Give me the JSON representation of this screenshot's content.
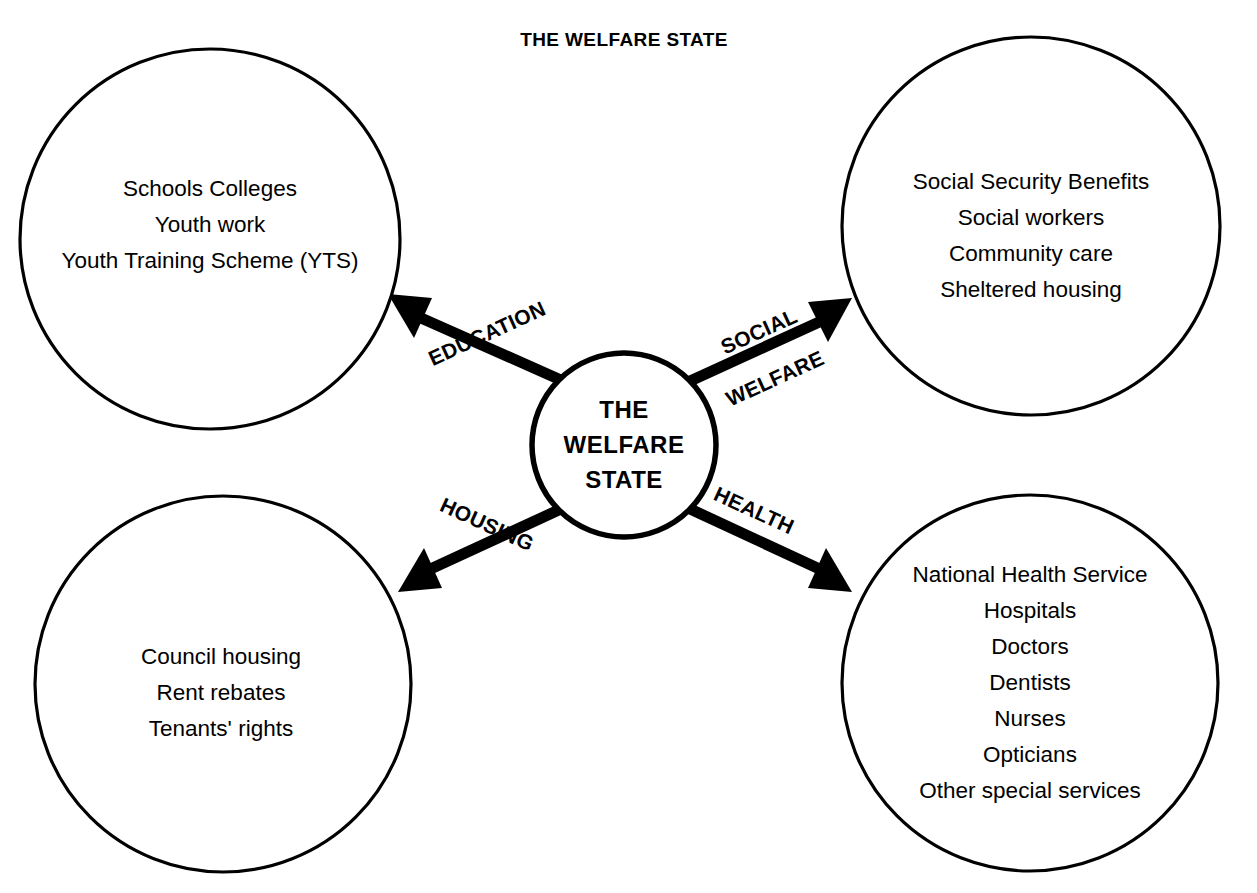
{
  "page": {
    "title": "THE WELFARE STATE",
    "background_color": "#ffffff",
    "stroke_color": "#000000",
    "width": 1257,
    "height": 893
  },
  "center_node": {
    "name": "the-welfare-state",
    "lines": [
      "THE",
      "WELFARE",
      "STATE"
    ],
    "cx": 624,
    "cy": 445,
    "r": 92
  },
  "edges": [
    {
      "id": "education",
      "label_lines": [
        "EDUCATION"
      ],
      "direction": "up-left",
      "target": "education-node"
    },
    {
      "id": "social-welfare",
      "label_lines": [
        "SOCIAL",
        "WELFARE"
      ],
      "direction": "up-right",
      "target": "social-welfare-node"
    },
    {
      "id": "housing",
      "label_lines": [
        "HOUSING"
      ],
      "direction": "down-left",
      "target": "housing-node"
    },
    {
      "id": "health",
      "label_lines": [
        "HEALTH"
      ],
      "direction": "down-right",
      "target": "health-node"
    }
  ],
  "nodes": [
    {
      "id": "education-node",
      "position": "top-left",
      "cx": 210,
      "cy": 239,
      "r": 190,
      "text_center_y": 236,
      "items": [
        "Schools Colleges",
        "Youth work",
        "Youth Training Scheme (YTS)"
      ]
    },
    {
      "id": "social-welfare-node",
      "position": "top-right",
      "cx": 1031,
      "cy": 226,
      "r": 189,
      "text_center_y": 231,
      "items": [
        "Social Security Benefits",
        "Social workers",
        "Community care",
        "Sheltered housing"
      ]
    },
    {
      "id": "housing-node",
      "position": "bottom-left",
      "cx": 223,
      "cy": 684,
      "r": 188,
      "text_center_y": 686,
      "items": [
        "Council housing",
        "Rent rebates",
        "Tenants' rights"
      ]
    },
    {
      "id": "health-node",
      "position": "bottom-right",
      "cx": 1030,
      "cy": 683,
      "r": 188,
      "text_center_y": 683,
      "items": [
        "National Health Service",
        "Hospitals",
        "Doctors",
        "Dentists",
        "Nurses",
        "Opticians",
        "Other special services"
      ]
    }
  ]
}
